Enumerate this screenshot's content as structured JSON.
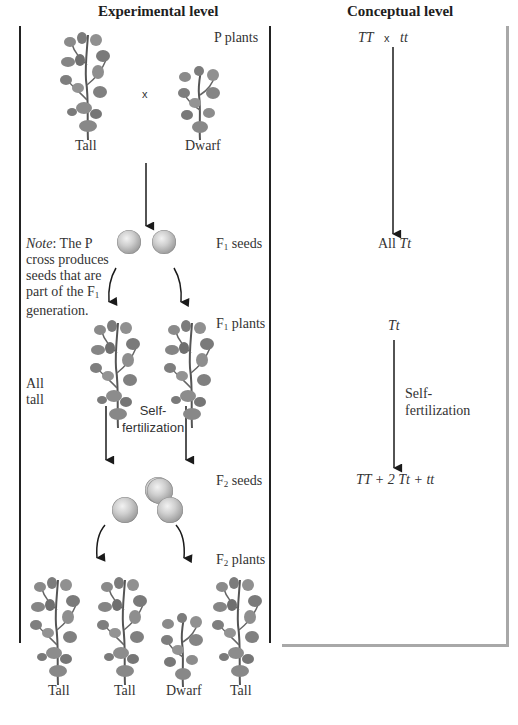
{
  "headers": {
    "experimental": "Experimental level",
    "conceptual": "Conceptual level"
  },
  "experimental": {
    "p_plants_label": "P plants",
    "cross_symbol": "x",
    "parent_labels": [
      "Tall",
      "Dwarf"
    ],
    "f1_seeds_label": "F",
    "f1_seeds_sub": "1",
    "f1_seeds_suffix": " seeds",
    "note": {
      "prefix": "Note",
      "line1": ":  The P",
      "line2": "cross produces",
      "line3": "seeds that are",
      "line4": "part of the F",
      "line4_sub": "1",
      "line5": "generation."
    },
    "f1_plants_label": "F",
    "f1_plants_sub": "1",
    "f1_plants_suffix": " plants",
    "all_tall_line1": "All",
    "all_tall_line2": "tall",
    "self_fert_line1": "Self-",
    "self_fert_line2": "fertilization",
    "f2_seeds_label": "F",
    "f2_seeds_sub": "2",
    "f2_seeds_suffix": " seeds",
    "f2_plants_label": "F",
    "f2_plants_sub": "2",
    "f2_plants_suffix": " plants",
    "offspring_labels": [
      "Tall",
      "Tall",
      "Dwarf",
      "Tall"
    ]
  },
  "conceptual": {
    "cross_left": "TT",
    "cross_symbol": "x",
    "cross_right": "tt",
    "f1_prefix": "All ",
    "f1_genotype": "Tt",
    "f1_plant_genotype": "Tt",
    "self_fert_line1": "Self-",
    "self_fert_line2": "fertilization",
    "f2_ratio": "TT + 2 Tt + tt"
  },
  "colors": {
    "line": "#222222",
    "frame_gray": "#a8a8a8",
    "text": "#333333"
  }
}
